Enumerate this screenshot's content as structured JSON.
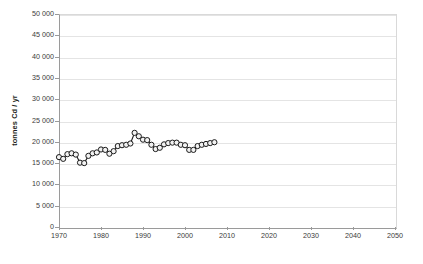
{
  "chart_data": {
    "type": "line",
    "title": "",
    "xlabel": "",
    "ylabel": "tonnes Cd / yr",
    "xlim": [
      1970,
      2050
    ],
    "ylim": [
      0,
      50000
    ],
    "xticks": [
      1970,
      1980,
      1990,
      2000,
      2010,
      2020,
      2030,
      2040,
      2050
    ],
    "xtick_labels": [
      "1970",
      "1980",
      "1990",
      "2000",
      "2010",
      "2020",
      "2030",
      "2040",
      "2050"
    ],
    "yticks": [
      0,
      5000,
      10000,
      15000,
      20000,
      25000,
      30000,
      35000,
      40000,
      45000,
      50000
    ],
    "ytick_labels": [
      "0",
      "5 000",
      "10 000",
      "15 000",
      "20 000",
      "25 000",
      "30 000",
      "35 000",
      "40 000",
      "45 000",
      "50 000"
    ],
    "grid": true,
    "legend": "none",
    "marker": "open-circle",
    "marker_face_color": "#f2f2f2",
    "marker_edge_color": "#1a1a1a",
    "line_color": "#1a1a1a",
    "x": [
      1970,
      1971,
      1972,
      1973,
      1974,
      1975,
      1976,
      1977,
      1978,
      1979,
      1980,
      1981,
      1982,
      1983,
      1984,
      1985,
      1986,
      1987,
      1988,
      1989,
      1990,
      1991,
      1992,
      1993,
      1994,
      1995,
      1996,
      1997,
      1998,
      1999,
      2000,
      2001,
      2002,
      2003,
      2004,
      2005,
      2006,
      2007
    ],
    "values": [
      16400,
      16000,
      17100,
      17300,
      17000,
      15100,
      15000,
      16700,
      17300,
      17500,
      18200,
      18100,
      17200,
      17800,
      19000,
      19200,
      19300,
      19600,
      22100,
      21300,
      20500,
      20400,
      19300,
      18300,
      18600,
      19400,
      19700,
      19800,
      19800,
      19300,
      19200,
      18100,
      18100,
      19000,
      19300,
      19500,
      19700,
      19900
    ],
    "series_name": "Cadmium production"
  },
  "axis": {
    "y_title": "tonnes Cd / yr"
  }
}
